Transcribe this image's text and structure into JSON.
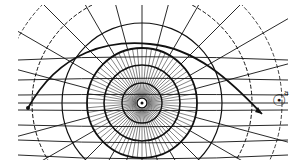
{
  "diagram": {
    "center": {
      "x": 142,
      "y": 103,
      "symbol": "central-body"
    },
    "trajectory": {
      "start": [
        28,
        108
      ],
      "peak": [
        145,
        45
      ],
      "end": [
        262,
        114
      ],
      "arrow": true
    },
    "labels": {
      "sun_symbol": "☉",
      "sun_superscript": "a"
    },
    "colors": {
      "ink": "#111111",
      "paper": "#ffffff"
    }
  }
}
